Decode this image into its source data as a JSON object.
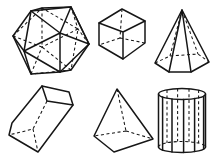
{
  "canvas": {
    "width": 214,
    "height": 160,
    "background": "#ffffff"
  },
  "style": {
    "stroke_color": "#161616",
    "solid_width": 1.5,
    "dashed_width": 1.05,
    "dash_pattern": "3 2.6"
  },
  "shapes": [
    {
      "name": "icosahedron",
      "solid": [
        "M31 11 L42 8 L71 7 L89 44 L71 70 L60 72 L31 74 L13 36 Z",
        "M60 72 L60 33 L71 7 M31 11 L60 33 L89 44 M60 33 L24 51",
        "M60 72 L89 44 L71 7 L31 11 L24 51 L60 72",
        "M31 74 L24 51 L13 36"
      ],
      "dashed": [
        "M42 8 L42 47 M78 29 L42 47 M71 70 L42 47 M31 74 L42 47 M13 36 L42 47",
        "M13 36 L42 8 L78 29 L71 70 L31 74",
        "M89 44 L78 29 L71 7"
      ]
    },
    {
      "name": "cube",
      "solid": [
        "M122 9 L145 21 L145 43 L123 59 L99 45 L99 23 Z",
        "M99 23 L123 32 L145 21 M123 32 L123 59"
      ],
      "dashed": [
        "M122 9 L120 38 M120 38 L99 45 M120 38 L145 43"
      ]
    },
    {
      "name": "hexagonal-pyramid",
      "solid": [
        "M182 10 L155 63 L169 72 L191 72 L209 62 Z",
        "M182 10 L169 72 M182 10 L191 72"
      ],
      "dashed": [
        "M182 10 L170 56 M182 10 L198 54",
        "M155 63 L170 56 L198 54 L209 62"
      ]
    },
    {
      "name": "rectangular-prism",
      "solid": [
        "M42 86 L69 92 L73 105 L38 152 L9 135 L12 123 Z",
        "M42 86 L47 101 L73 105"
      ],
      "dashed": [
        "M47 101 L33 129 L9 135 M33 129 L38 152"
      ]
    },
    {
      "name": "square-pyramid",
      "solid": [
        "M117 89 L94 136 L114 152 L153 139 Z"
      ],
      "dashed": [
        "M117 89 L126 131 M126 131 L94 136 M126 131 L153 139"
      ]
    },
    {
      "name": "cylinder-prism",
      "solid": [
        "M158.5 94 A23.5 5.5 0 0 1 205.5 94 A23.5 5.5 0 0 1 158.5 94",
        "M158.5 147 A23.5 5.5 0 0 0 205.5 147",
        "M158.5 94 L158.5 147 M162.6 97 L162.6 150 M172 99 L172 152 M183.6 99.5 L183.6 152.5 M194.6 98.6 L194.6 151.6 M203.6 96.2 L203.6 149.2 M205.5 94 L205.5 147"
      ],
      "dashed": [
        "M167 90 L167 143 M177.6 88.6 L177.6 141.6 M189 88.7 L189 141.7 M198.6 90 L198.6 143",
        "M158.5 147 A23.5 5.5 0 0 1 205.5 147"
      ]
    }
  ]
}
